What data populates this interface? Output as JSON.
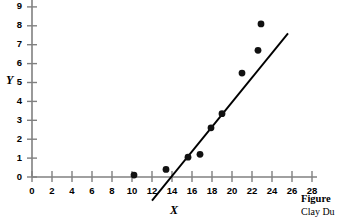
{
  "figure": {
    "caption_label": "Figure",
    "caption_credit": "Clay Du"
  },
  "chart_data": {
    "type": "scatter",
    "title": "",
    "xlabel": "X",
    "ylabel": "Y",
    "xlim": [
      0,
      28
    ],
    "ylim": [
      0,
      9
    ],
    "xticks": [
      0,
      2,
      4,
      6,
      8,
      10,
      12,
      14,
      16,
      18,
      20,
      22,
      24,
      26,
      28
    ],
    "yticks": [
      0,
      1,
      2,
      3,
      4,
      5,
      6,
      7,
      8,
      9
    ],
    "xtick_labels": [
      "0",
      "2",
      "4",
      "6",
      "8",
      "10",
      "12",
      "14",
      "16",
      "18",
      "20",
      "22",
      "24",
      "26",
      "28"
    ],
    "ytick_labels": [
      "0",
      "1",
      "2",
      "3",
      "4",
      "5",
      "6",
      "7",
      "8",
      "9"
    ],
    "grid": false,
    "legend": null,
    "marker_color": "#111111",
    "axis_color": "#808080",
    "line_color": "#000000",
    "points": [
      {
        "x": 10.2,
        "y": 0.1
      },
      {
        "x": 13.4,
        "y": 0.4
      },
      {
        "x": 15.6,
        "y": 1.05
      },
      {
        "x": 16.8,
        "y": 1.2
      },
      {
        "x": 17.9,
        "y": 2.6
      },
      {
        "x": 19.0,
        "y": 3.35
      },
      {
        "x": 21.0,
        "y": 5.5
      },
      {
        "x": 22.6,
        "y": 6.7
      },
      {
        "x": 22.9,
        "y": 8.1
      }
    ],
    "fit_line": {
      "x0": 12.0,
      "y0": -1.25,
      "x1": 25.6,
      "y1": 7.6
    }
  }
}
